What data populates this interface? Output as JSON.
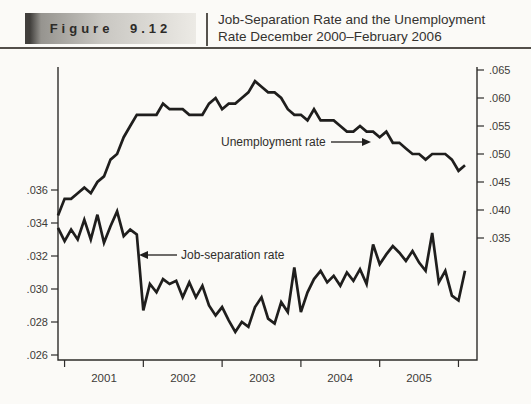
{
  "header": {
    "figure_label": "Figure 9.12",
    "title_line1": "Job-Separation Rate and the Unemployment",
    "title_line2": "Rate December 2000–February 2006"
  },
  "chart_data": {
    "type": "line",
    "x_start": "December 2000",
    "x_end": "February 2006",
    "x_frequency": "monthly",
    "x_tick_year_labels": [
      "2001",
      "2002",
      "2003",
      "2004",
      "2005"
    ],
    "grid": false,
    "line_color": "#1f1e1d",
    "axis_color": "#2e2c2a",
    "left_axis": {
      "series": "Job-separation rate",
      "labels": [
        ".036",
        ".034",
        ".032",
        ".030",
        ".028",
        ".026"
      ],
      "min": 0.026,
      "max": 0.036
    },
    "right_axis": {
      "series": "Unemployment rate",
      "labels": [
        ".065",
        ".060",
        ".055",
        ".050",
        ".045",
        ".040",
        ".035"
      ],
      "min": 0.035,
      "max": 0.065
    },
    "series": [
      {
        "name": "Unemployment rate",
        "axis": "right",
        "values": [
          0.039,
          0.042,
          0.042,
          0.043,
          0.044,
          0.043,
          0.045,
          0.046,
          0.049,
          0.05,
          0.053,
          0.055,
          0.057,
          0.057,
          0.057,
          0.057,
          0.059,
          0.058,
          0.058,
          0.058,
          0.057,
          0.057,
          0.057,
          0.059,
          0.06,
          0.058,
          0.059,
          0.059,
          0.06,
          0.061,
          0.063,
          0.062,
          0.061,
          0.061,
          0.06,
          0.058,
          0.057,
          0.057,
          0.056,
          0.058,
          0.056,
          0.056,
          0.056,
          0.055,
          0.054,
          0.054,
          0.055,
          0.054,
          0.054,
          0.053,
          0.054,
          0.052,
          0.052,
          0.051,
          0.05,
          0.05,
          0.049,
          0.05,
          0.05,
          0.05,
          0.049,
          0.047,
          0.048
        ]
      },
      {
        "name": "Job-separation rate",
        "axis": "left",
        "values": [
          0.0337,
          0.0329,
          0.0336,
          0.033,
          0.0342,
          0.033,
          0.0345,
          0.0328,
          0.0338,
          0.0347,
          0.0332,
          0.0336,
          0.0333,
          0.0287,
          0.0303,
          0.0298,
          0.0306,
          0.0303,
          0.0305,
          0.0295,
          0.0304,
          0.0295,
          0.0302,
          0.029,
          0.0284,
          0.0289,
          0.0281,
          0.0274,
          0.028,
          0.0277,
          0.0289,
          0.0295,
          0.0282,
          0.0279,
          0.0292,
          0.0286,
          0.0313,
          0.0286,
          0.0298,
          0.0306,
          0.0311,
          0.0304,
          0.0308,
          0.0302,
          0.031,
          0.0305,
          0.0312,
          0.0303,
          0.0327,
          0.0315,
          0.0321,
          0.0326,
          0.0322,
          0.0317,
          0.0323,
          0.0316,
          0.0311,
          0.0334,
          0.0304,
          0.0311,
          0.0296,
          0.0293,
          0.0311
        ]
      }
    ],
    "annotations": {
      "unemployment": {
        "text": "Unemployment rate"
      },
      "job_separation": {
        "text": "Job-separation rate"
      }
    }
  }
}
